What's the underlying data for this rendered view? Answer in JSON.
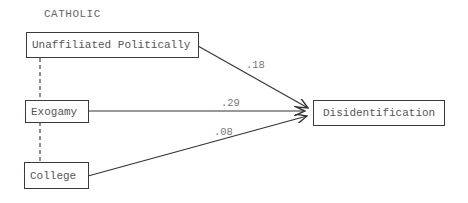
{
  "title": "CATHOLIC",
  "nodes": {
    "unaffiliated": {
      "label": "Unaffiliated Politically"
    },
    "exogamy": {
      "label": "Exogamy"
    },
    "college": {
      "label": "College"
    },
    "disidentification": {
      "label": "Disidentification"
    }
  },
  "paths": [
    {
      "from": "Unaffiliated Politically",
      "to": "Disidentification",
      "coefficient": ".18"
    },
    {
      "from": "Exogamy",
      "to": "Disidentification",
      "coefficient": ".29"
    },
    {
      "from": "College",
      "to": "Disidentification",
      "coefficient": ".08"
    }
  ],
  "correlations": [
    {
      "from": "Unaffiliated Politically",
      "to": "Exogamy",
      "style": "dashed"
    },
    {
      "from": "Exogamy",
      "to": "College",
      "style": "dashed"
    }
  ]
}
